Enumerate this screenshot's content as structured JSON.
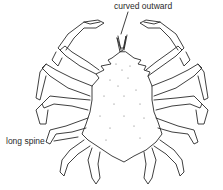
{
  "diagram": {
    "labels": [
      {
        "id": "rostrum",
        "text": "curved outward"
      },
      {
        "id": "spine",
        "text": "long spine"
      }
    ],
    "colors": {
      "line": "#2a2a2a",
      "background": "#ffffff"
    }
  }
}
